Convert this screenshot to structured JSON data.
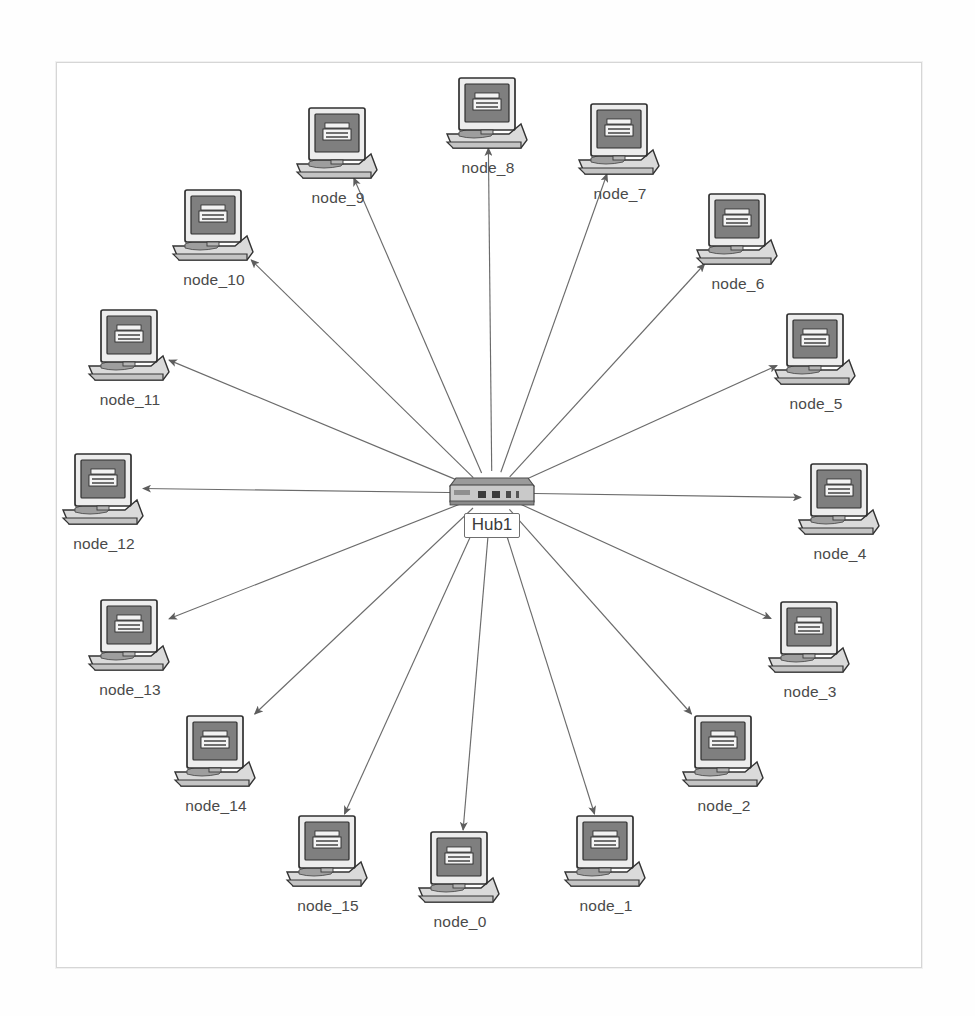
{
  "diagram": {
    "type": "network-topology",
    "layout": "star",
    "canvas": {
      "x": 56,
      "y": 62,
      "width": 866,
      "height": 906,
      "background": "#ffffff",
      "border_color": "#d6d6d6"
    },
    "colors": {
      "edge": "#6b6b6b",
      "label_text": "#4a4a4a",
      "monitor_bezel": "#f0f0f0",
      "monitor_screen": "#808080",
      "monitor_outline": "#3c3c3c",
      "base": "#dcdcdc",
      "hub_body": "#909090"
    },
    "hub": {
      "id": "hub1",
      "label": "Hub1",
      "icon": "hub-device-icon",
      "x": 432,
      "y": 470
    },
    "nodes": [
      {
        "id": "node_0",
        "label": "node_0",
        "icon": "computer-icon",
        "x": 412,
        "y": 828,
        "angle_deg": 90
      },
      {
        "id": "node_1",
        "label": "node_1",
        "icon": "computer-icon",
        "x": 558,
        "y": 812,
        "angle_deg": 67
      },
      {
        "id": "node_2",
        "label": "node_2",
        "icon": "computer-icon",
        "x": 676,
        "y": 712,
        "angle_deg": 45
      },
      {
        "id": "node_3",
        "label": "node_3",
        "icon": "computer-icon",
        "x": 762,
        "y": 598,
        "angle_deg": 23
      },
      {
        "id": "node_4",
        "label": "node_4",
        "icon": "computer-icon",
        "x": 792,
        "y": 460,
        "angle_deg": 0
      },
      {
        "id": "node_5",
        "label": "node_5",
        "icon": "computer-icon",
        "x": 768,
        "y": 310,
        "angle_deg": -23
      },
      {
        "id": "node_6",
        "label": "node_6",
        "icon": "computer-icon",
        "x": 690,
        "y": 190,
        "angle_deg": -45
      },
      {
        "id": "node_7",
        "label": "node_7",
        "icon": "computer-icon",
        "x": 572,
        "y": 100,
        "angle_deg": -67
      },
      {
        "id": "node_8",
        "label": "node_8",
        "icon": "computer-icon",
        "x": 440,
        "y": 74,
        "angle_deg": -90
      },
      {
        "id": "node_9",
        "label": "node_9",
        "icon": "computer-icon",
        "x": 290,
        "y": 104,
        "angle_deg": -113
      },
      {
        "id": "node_10",
        "label": "node_10",
        "icon": "computer-icon",
        "x": 166,
        "y": 186,
        "angle_deg": -135
      },
      {
        "id": "node_11",
        "label": "node_11",
        "icon": "computer-icon",
        "x": 82,
        "y": 306,
        "angle_deg": -157
      },
      {
        "id": "node_12",
        "label": "node_12",
        "icon": "computer-icon",
        "x": 56,
        "y": 450,
        "angle_deg": 180
      },
      {
        "id": "node_13",
        "label": "node_13",
        "icon": "computer-icon",
        "x": 82,
        "y": 596,
        "angle_deg": 157
      },
      {
        "id": "node_14",
        "label": "node_14",
        "icon": "computer-icon",
        "x": 168,
        "y": 712,
        "angle_deg": 135
      },
      {
        "id": "node_15",
        "label": "node_15",
        "icon": "computer-icon",
        "x": 280,
        "y": 812,
        "angle_deg": 113
      }
    ],
    "links": [
      {
        "from": "hub1",
        "to": "node_0",
        "arrow": "to-node"
      },
      {
        "from": "hub1",
        "to": "node_1",
        "arrow": "to-node"
      },
      {
        "from": "hub1",
        "to": "node_2",
        "arrow": "to-node"
      },
      {
        "from": "hub1",
        "to": "node_3",
        "arrow": "to-node"
      },
      {
        "from": "hub1",
        "to": "node_4",
        "arrow": "to-node"
      },
      {
        "from": "hub1",
        "to": "node_5",
        "arrow": "to-node"
      },
      {
        "from": "hub1",
        "to": "node_6",
        "arrow": "to-node"
      },
      {
        "from": "hub1",
        "to": "node_7",
        "arrow": "to-node"
      },
      {
        "from": "hub1",
        "to": "node_8",
        "arrow": "to-node"
      },
      {
        "from": "hub1",
        "to": "node_9",
        "arrow": "to-node"
      },
      {
        "from": "hub1",
        "to": "node_10",
        "arrow": "to-node"
      },
      {
        "from": "hub1",
        "to": "node_11",
        "arrow": "to-node"
      },
      {
        "from": "hub1",
        "to": "node_12",
        "arrow": "to-node"
      },
      {
        "from": "hub1",
        "to": "node_13",
        "arrow": "to-node"
      },
      {
        "from": "hub1",
        "to": "node_14",
        "arrow": "to-node"
      },
      {
        "from": "hub1",
        "to": "node_15",
        "arrow": "to-node"
      }
    ]
  }
}
